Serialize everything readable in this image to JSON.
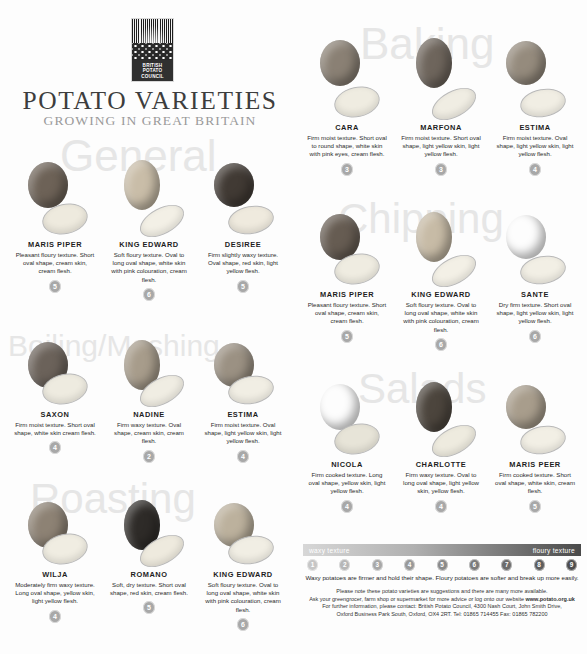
{
  "header": {
    "logo": {
      "line1": "BRITISH",
      "line2": "POTATO",
      "line3": "COUNCIL",
      "name": "british-potato-council-logo"
    },
    "title": "POTATO VARIETIES",
    "subtitle": "GROWING IN GREAT BRITAIN"
  },
  "sections": [
    {
      "id": "general",
      "label": "General",
      "varieties": [
        {
          "name": "MARIS PIPER",
          "desc": "Pleasant floury texture. Short oval shape, cream skin, cream flesh.",
          "rating": "5",
          "skin": "#6d6257",
          "flesh": "#eeeade"
        },
        {
          "name": "KING EDWARD",
          "desc": "Soft floury texture. Oval to long oval shape, white skin with pink colouration, cream flesh.",
          "rating": "6",
          "skin": "#c9bda8",
          "flesh": "#f3f0e6"
        },
        {
          "name": "DESIREE",
          "desc": "Firm slightly waxy texture. Oval shape, red skin, light yellow flesh.",
          "rating": "5",
          "skin": "#413a34",
          "flesh": "#efeade"
        }
      ]
    },
    {
      "id": "boiling-mashing",
      "label": "Boiling/Mashing",
      "varieties": [
        {
          "name": "SAXON",
          "desc": "Firm moist texture. Short oval shape, white skin cream flesh.",
          "rating": "4",
          "skin": "#6b625a",
          "flesh": "#eeebe0"
        },
        {
          "name": "NADINE",
          "desc": "Firm waxy texture. Oval shape, cream skin, cream flesh.",
          "rating": "2",
          "skin": "#a79c8b",
          "flesh": "#f0ede3"
        },
        {
          "name": "ESTIMA",
          "desc": "Firm moist texture. Oval shape, light yellow skin, light yellow flesh.",
          "rating": "4",
          "skin": "#9b9183",
          "flesh": "#f1eee4"
        }
      ]
    },
    {
      "id": "roasting",
      "label": "Roasting",
      "varieties": [
        {
          "name": "WILJA",
          "desc": "Moderately firm waxy texture. Long oval shape, yellow skin, light yellow flesh.",
          "rating": "4",
          "skin": "#8d8274",
          "flesh": "#f0ede2"
        },
        {
          "name": "ROMANO",
          "desc": "Soft, dry texture. Short oval shape, red skin, cream flesh.",
          "rating": "5",
          "skin": "#2e2b28",
          "flesh": "#eeeade"
        },
        {
          "name": "KING EDWARD",
          "desc": "Soft floury texture. Oval to long oval shape, white skin with pink colouration, cream flesh.",
          "rating": "6",
          "skin": "#bcb19d",
          "flesh": "#f1eee4"
        }
      ]
    },
    {
      "id": "baking",
      "label": "Baking",
      "varieties": [
        {
          "name": "CARA",
          "desc": "Firm moist texture. Short oval to round shape, white skin with pink eyes, cream flesh.",
          "rating": "3",
          "skin": "#8a8074",
          "flesh": "#efece1"
        },
        {
          "name": "MARFONA",
          "desc": "Firm moist texture. Short oval shape, light yellow skin, light yellow flesh.",
          "rating": "3",
          "skin": "#6e655c",
          "flesh": "#f0ede3"
        },
        {
          "name": "ESTIMA",
          "desc": "Firm moist texture. Oval shape, light yellow skin, light yellow flesh.",
          "rating": "4",
          "skin": "#958b7d",
          "flesh": "#f1eee4"
        }
      ]
    },
    {
      "id": "chipping",
      "label": "Chipping",
      "varieties": [
        {
          "name": "MARIS PIPER",
          "desc": "Pleasant floury texture. Short oval shape, cream skin, cream flesh.",
          "rating": "5",
          "skin": "#665c52",
          "flesh": "#efece1"
        },
        {
          "name": "KING EDWARD",
          "desc": "Soft floury texture. Oval to long oval shape, white skin with pink colouration, cream flesh.",
          "rating": "6",
          "skin": "#c7bba6",
          "flesh": "#f3f0e6"
        },
        {
          "name": "SANTE",
          "desc": "Dry firm texture. Short oval shape, light yellow skin, light yellow flesh.",
          "rating": "6",
          "skin": "#736а5f",
          "flesh": "#f2efe5"
        }
      ]
    },
    {
      "id": "salads",
      "label": "Salads",
      "varieties": [
        {
          "name": "NICOLA",
          "desc": "Firm cooked texture. Long oval shape, yellow skin, light yellow flesh.",
          "rating": "4",
          "skin": "#8e8density",
          "flesh": "#e7e4d8"
        },
        {
          "name": "CHARLOTTE",
          "desc": "Firm waxy texture. Oval to long oval shape, light yellow skin, yellow flesh.",
          "rating": "4",
          "skin": "#4c453d",
          "flesh": "#eeebdf"
        },
        {
          "name": "MARIS PEER",
          "desc": "Firm cooked texture. Short oval shape, white skin, cream flesh.",
          "rating": "5",
          "skin": "#a89d8c",
          "flesh": "#f2efe5"
        }
      ]
    }
  ],
  "scale": {
    "left_label": "waxy texture",
    "right_label": "floury texture",
    "numbers": [
      "1",
      "2",
      "3",
      "4",
      "5",
      "6",
      "7",
      "8",
      "9"
    ],
    "note": "Waxy potatoes are firmer and hold their shape. Floury potatoes are softer and break up more easily."
  },
  "footer": {
    "line1": "Please note these potato varieties are suggestions and there are many more available.",
    "line2": "Ask your greengrocer, farm shop or supermarket for more advice or log onto our website ",
    "line2_bold": "www.potato.org.uk",
    "line3": "For further information, please contact: British Potato Council, 4300 Nash Court, John Smith Drive,",
    "line4": "Oxford Business Park South, Oxford, OX4 2RT.  Tel: 01865 714455  Fax: 01865 782200"
  }
}
